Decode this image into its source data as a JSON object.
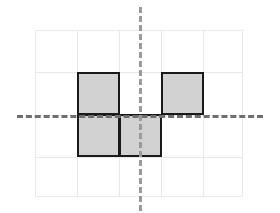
{
  "figure": {
    "canvas": {
      "width": 280,
      "height": 213,
      "background": "#ffffff"
    },
    "grid": {
      "origin_x": 35,
      "origin_y": 30,
      "cell_size": 42,
      "columns": 5,
      "rows": 4,
      "line_color": "#e8e8e8",
      "visible": true
    },
    "shape": {
      "name": "s-tetromino-like-figure",
      "fill_color": "#d2d2d2",
      "stroke_color": "#1a1a1a",
      "stroke_width": 2,
      "cell_count": 4,
      "cells": [
        {
          "name": "upper-left-square",
          "col": 1,
          "row": 1
        },
        {
          "name": "upper-right-square",
          "col": 3,
          "row": 1
        },
        {
          "name": "lower-left-square",
          "col": 1,
          "row": 2
        },
        {
          "name": "lower-middle-square",
          "col": 2,
          "row": 2
        }
      ]
    },
    "axes": [
      {
        "name": "horizontal-dashed-axis",
        "orientation": "horizontal",
        "color": "#6e6e6e",
        "dash_width": 3,
        "position_y": 115,
        "start_x": 17,
        "end_x": 263
      },
      {
        "name": "vertical-dashed-axis",
        "orientation": "vertical",
        "color": "#9a9a9a",
        "dash_width": 3,
        "position_x": 139,
        "start_y": 7,
        "end_y": 211
      }
    ]
  }
}
